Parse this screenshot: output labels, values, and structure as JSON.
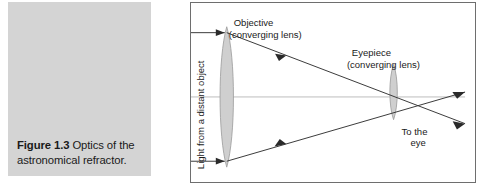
{
  "figure": {
    "caption_label": "Figure 1.3",
    "caption_body": " Optics of the astronomical refractor.",
    "caption_full": "Figure 1.3 Optics of the astronomical refractor."
  },
  "diagram": {
    "title": "Optics of the astronomical refractor",
    "labels": {
      "incoming_light": "Light from a distant object",
      "objective_name": "Objective",
      "objective_sub": "(converging lens)",
      "eyepiece_name": "Eyepiece",
      "eyepiece_sub": "(converging lens)",
      "to_the_eye_line1": "To the",
      "to_the_eye_line2": "eye"
    },
    "elements": {
      "objective_lens": "objective-converging-lens",
      "eyepiece_lens": "eyepiece-converging-lens",
      "optical_axis": "optical-axis",
      "ray_top": "light-ray-upper",
      "ray_bottom": "light-ray-lower",
      "exit_ray_upper": "exit-ray-upper",
      "exit_ray_lower": "exit-ray-lower"
    },
    "colors": {
      "border": "#6e6e6e",
      "caption_panel": "#d4d4d4",
      "lens_fill": "#cfcfcf",
      "lens_stroke": "#9a9a9a",
      "ray_stroke": "#3a3a3a",
      "axis_stroke": "#b5b5b5",
      "text": "#1a1a1a"
    }
  }
}
